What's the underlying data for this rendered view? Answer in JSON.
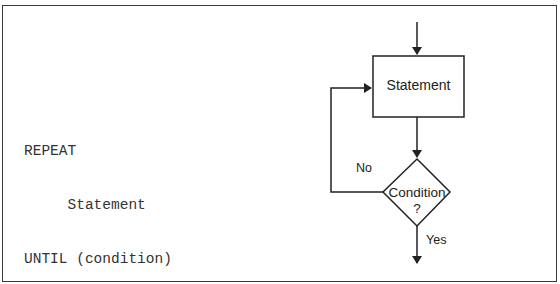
{
  "pseudocode": {
    "lines": [
      "REPEAT",
      "     Statement",
      "UNTIL (condition)"
    ]
  },
  "flowchart": {
    "process_box": {
      "label": "Statement"
    },
    "decision": {
      "line1": "Condition",
      "line2": "?"
    },
    "branches": {
      "no_label": "No",
      "yes_label": "Yes"
    }
  }
}
